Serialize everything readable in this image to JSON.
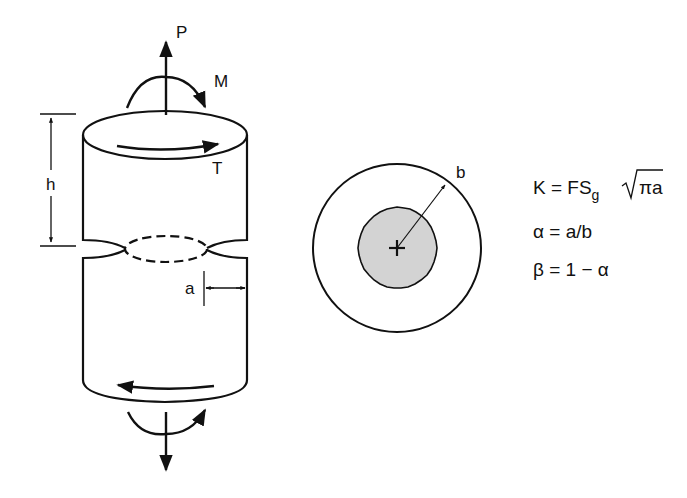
{
  "diagram": {
    "type": "mechanics-diagram",
    "cylinder": {
      "load_labels": {
        "axial_load": "P",
        "bending_moment": "M",
        "torque": "T"
      },
      "dimension_labels": {
        "height": "h",
        "crack_depth": "a"
      }
    },
    "cross_section": {
      "radius_label": "b"
    },
    "equations": {
      "eq1_lhs": "K = FS",
      "eq1_sub": "g",
      "eq1_sqrt": "πa",
      "eq2": "α = a/b",
      "eq3": "β = 1 − α"
    },
    "colors": {
      "stroke": "#111111",
      "crack_fill": "#d3d3d3",
      "background": "#ffffff"
    }
  }
}
